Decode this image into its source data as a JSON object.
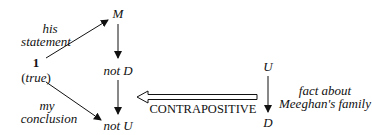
{
  "nodes": {
    "one": "1",
    "true_label": "(true)",
    "M": "M",
    "not_D": "not D",
    "not_U": "not U",
    "U": "U",
    "D": "D"
  },
  "edge_labels": {
    "his_statement_line1": "his",
    "his_statement_line2": "statement",
    "my_conclusion_line1": "my",
    "my_conclusion_line2": "conclusion",
    "fact_line1": "fact about",
    "fact_line2": "Meeghan's family",
    "contrapositive": "CONTRAPOSITIVE"
  }
}
